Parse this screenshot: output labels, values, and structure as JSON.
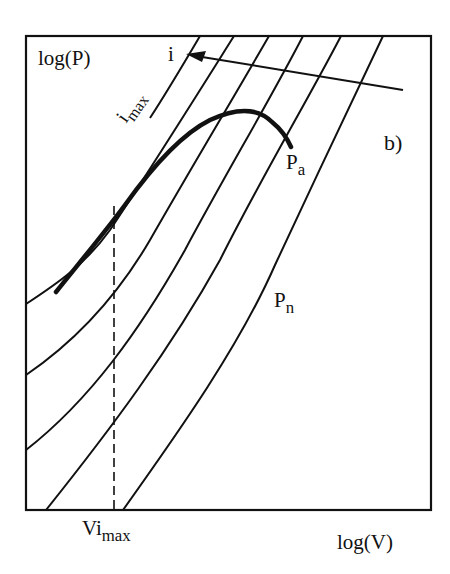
{
  "figure": {
    "panel_label": "b)",
    "y_axis_label": "log(P)",
    "x_axis_label": "log(V)",
    "current_arrow_label": "i",
    "imax_label": {
      "base": "i",
      "sub": "max"
    },
    "pa_label": {
      "base": "P",
      "sub": "a"
    },
    "pn_label": {
      "base": "P",
      "sub": "n"
    },
    "vimax_label": {
      "base": "Vi",
      "sub": "max"
    },
    "colors": {
      "line": "#111111",
      "background": "#ffffff"
    }
  },
  "diagram": {
    "elements": [
      "frame",
      "constant-current curves (7)",
      "current direction arrow (i)",
      "thick power envelope curve ending at P_a",
      "dashed vertical line at Vi_max"
    ]
  }
}
